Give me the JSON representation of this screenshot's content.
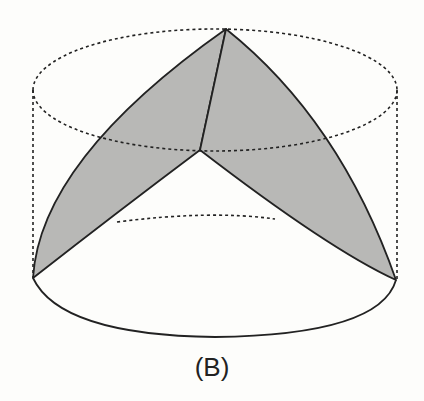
{
  "figure": {
    "label": "(B)",
    "colors": {
      "background": "#fdfdfb",
      "shade": "#b8b8b6",
      "stroke": "#222222"
    }
  }
}
